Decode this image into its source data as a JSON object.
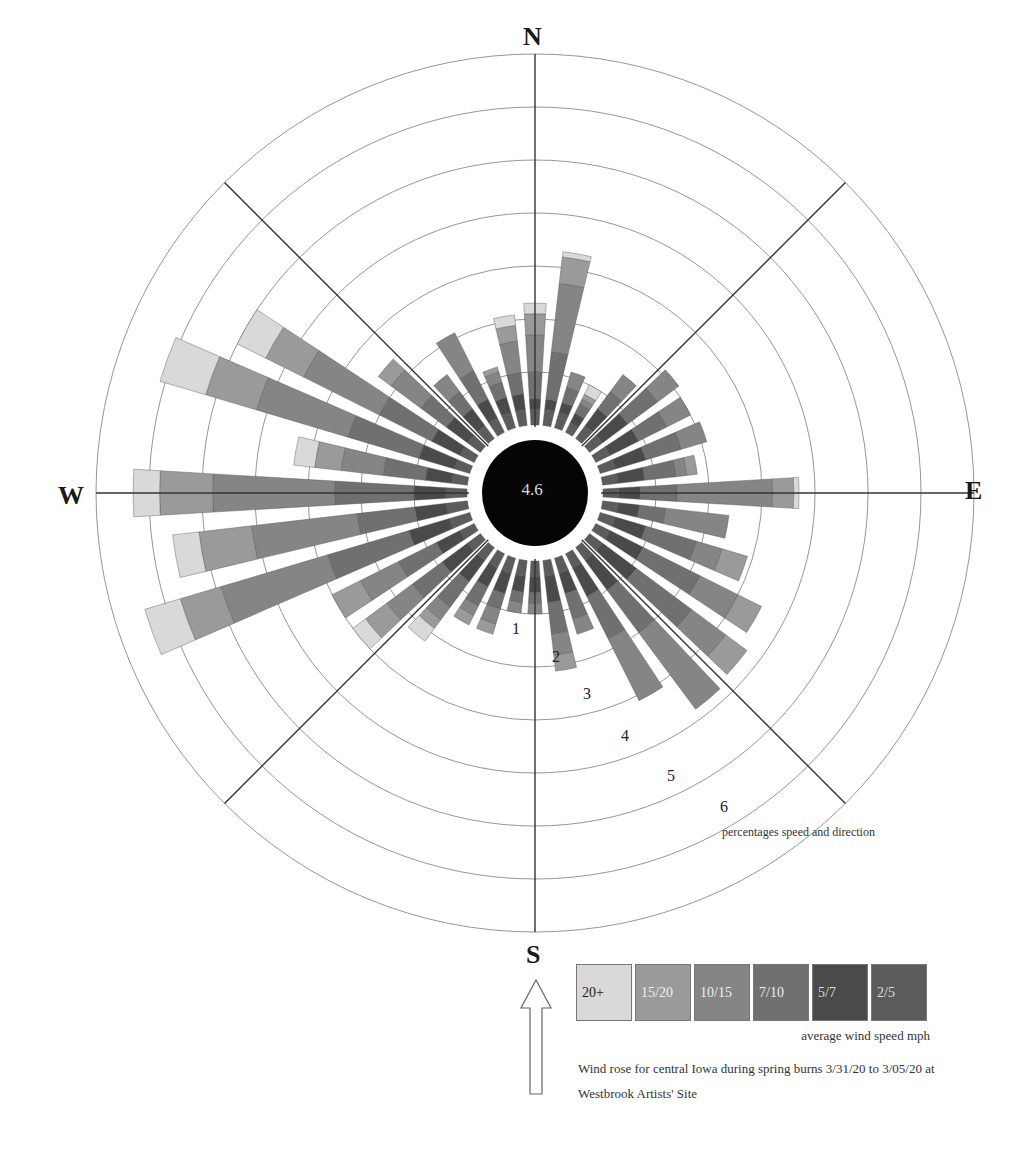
{
  "chart_data": {
    "type": "wind_rose",
    "title": "Wind rose for central Iowa during spring burns 3/31/20 to 3/05/20 at Westbrook Artists' Site",
    "center_value": "4.6",
    "cardinals": {
      "N": "N",
      "E": "E",
      "S": "S",
      "W": "W"
    },
    "radial_axis": {
      "label": "percentages speed and direction",
      "ticks": [
        "1",
        "2",
        "3",
        "4",
        "5",
        "6"
      ],
      "rings": 7,
      "range": [
        0,
        7
      ]
    },
    "legend": {
      "title": "average wind speed mph",
      "bins": [
        {
          "label": "20+",
          "color": "#d9d9d9",
          "text_color": "#222222"
        },
        {
          "label": "15/20",
          "color": "#9a9a9a",
          "text_color": "#eeeeee"
        },
        {
          "label": "10/15",
          "color": "#858585",
          "text_color": "#eeeeee"
        },
        {
          "label": "7/10",
          "color": "#707070",
          "text_color": "#eeeeee"
        },
        {
          "label": "5/7",
          "color": "#4a4a4a",
          "text_color": "#dddddd"
        },
        {
          "label": "2/5",
          "color": "#5c5c5c",
          "text_color": "#dddddd"
        }
      ]
    },
    "directions_deg": [
      0,
      10,
      20,
      30,
      40,
      50,
      60,
      70,
      80,
      90,
      100,
      110,
      120,
      130,
      140,
      150,
      160,
      170,
      180,
      190,
      200,
      210,
      220,
      230,
      240,
      250,
      260,
      270,
      280,
      290,
      300,
      310,
      320,
      330,
      340,
      350
    ],
    "series_order_inner_to_outer": [
      "2/5",
      "5/7",
      "7/10",
      "10/15",
      "15/20",
      "20+"
    ],
    "values_percent": [
      [
        0.3,
        0.2,
        0.5,
        0.7,
        0.4,
        0.2
      ],
      [
        0.3,
        0.2,
        0.9,
        1.3,
        0.5,
        0.1
      ],
      [
        0.3,
        0.2,
        0.3,
        0.3,
        0.0,
        0.0
      ],
      [
        0.2,
        0.2,
        0.2,
        0.1,
        0.1,
        0.2
      ],
      [
        0.3,
        0.4,
        0.4,
        0.4,
        0.0,
        0.0
      ],
      [
        0.3,
        0.6,
        0.7,
        0.5,
        0.0,
        0.0
      ],
      [
        0.3,
        0.6,
        0.6,
        0.5,
        0.0,
        0.0
      ],
      [
        0.3,
        0.6,
        0.7,
        0.5,
        0.0,
        0.0
      ],
      [
        0.3,
        0.5,
        0.6,
        0.2,
        0.2,
        0.0
      ],
      [
        0.3,
        0.4,
        0.7,
        1.8,
        0.4,
        0.1
      ],
      [
        0.3,
        0.4,
        0.5,
        1.2,
        0.0,
        0.0
      ],
      [
        0.3,
        0.6,
        1.0,
        0.5,
        0.5,
        0.0
      ],
      [
        0.3,
        0.7,
        1.2,
        0.8,
        0.5,
        0.0
      ],
      [
        0.3,
        0.8,
        1.3,
        0.8,
        0.5,
        0.0
      ],
      [
        0.3,
        0.7,
        1.0,
        1.8,
        0.0,
        0.0
      ],
      [
        0.3,
        0.6,
        0.9,
        1.3,
        0.0,
        0.0
      ],
      [
        0.3,
        0.4,
        0.5,
        0.3,
        0.0,
        0.0
      ],
      [
        0.3,
        0.5,
        0.6,
        0.4,
        0.3,
        0.0
      ],
      [
        0.3,
        0.3,
        0.2,
        0.2,
        0.0,
        0.0
      ],
      [
        0.3,
        0.3,
        0.2,
        0.2,
        0.0,
        0.0
      ],
      [
        0.3,
        0.4,
        0.3,
        0.3,
        0.2,
        0.0
      ],
      [
        0.3,
        0.4,
        0.4,
        0.2,
        0.2,
        0.0
      ],
      [
        0.3,
        0.5,
        0.6,
        0.3,
        0.2,
        0.3
      ],
      [
        0.3,
        0.6,
        0.7,
        0.6,
        0.5,
        0.3
      ],
      [
        0.3,
        0.5,
        0.8,
        0.8,
        0.6,
        0.0
      ],
      [
        0.4,
        0.8,
        1.6,
        2.1,
        0.8,
        0.7
      ],
      [
        0.4,
        0.6,
        1.1,
        2.0,
        1.0,
        0.5
      ],
      [
        0.4,
        0.6,
        1.5,
        2.3,
        1.0,
        0.5
      ],
      [
        0.3,
        0.5,
        0.8,
        0.8,
        0.5,
        0.4
      ],
      [
        0.3,
        0.7,
        1.4,
        1.8,
        1.0,
        0.9
      ],
      [
        0.3,
        0.6,
        1.1,
        1.6,
        0.8,
        0.6
      ],
      [
        0.3,
        0.5,
        0.6,
        0.7,
        0.3,
        0.0
      ],
      [
        0.3,
        0.4,
        0.4,
        0.4,
        0.0,
        0.0
      ],
      [
        0.3,
        0.4,
        0.6,
        0.8,
        0.0,
        0.0
      ],
      [
        0.3,
        0.3,
        0.3,
        0.2,
        0.1,
        0.0
      ],
      [
        0.3,
        0.3,
        0.4,
        0.6,
        0.3,
        0.2
      ]
    ],
    "layout": {
      "grid": true,
      "legend_position": "bottom-right"
    }
  },
  "labels": {
    "north": "N",
    "east": "E",
    "south": "S",
    "west": "W",
    "center": "4.6",
    "ring_1": "1",
    "ring_2": "2",
    "ring_3": "3",
    "ring_4": "4",
    "ring_5": "5",
    "ring_6": "6",
    "radial_caption": "percentages speed and direction",
    "legend_0": "20+",
    "legend_1": "15/20",
    "legend_2": "10/15",
    "legend_3": "7/10",
    "legend_4": "5/7",
    "legend_5": "2/5",
    "legend_caption": "average wind speed mph",
    "note": "Wind rose for central Iowa during spring burns 3/31/20 to 3/05/20 at Westbrook Artists' Site"
  },
  "icons": {
    "north_arrow": "up-arrow-outline"
  }
}
